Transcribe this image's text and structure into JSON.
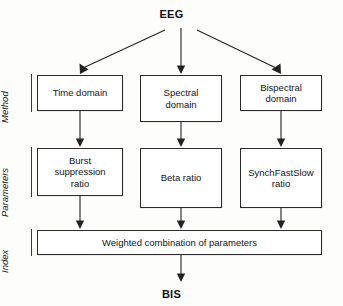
{
  "diagram": {
    "title_top": "EEG",
    "title_bottom": "BIS",
    "tiers": [
      {
        "id": "method",
        "label": "Method"
      },
      {
        "id": "parameters",
        "label": "Parameters"
      },
      {
        "id": "index",
        "label": "Index"
      }
    ],
    "nodes": {
      "time_domain": "Time domain",
      "spectral_domain": "Spectral\ndomain",
      "bispectral_domain": "Bispectral\ndomain",
      "burst_ratio": "Burst\nsuppression\nratio",
      "beta_ratio": "Beta ratio",
      "synch_ratio": "SynchFastSlow\nratio",
      "weighted": "Weighted combination of parameters"
    },
    "edges": [
      {
        "from": "EEG",
        "to": "Time domain"
      },
      {
        "from": "EEG",
        "to": "Spectral domain"
      },
      {
        "from": "EEG",
        "to": "Bispectral domain"
      },
      {
        "from": "Time domain",
        "to": "Burst suppression ratio"
      },
      {
        "from": "Spectral domain",
        "to": "Beta ratio"
      },
      {
        "from": "Bispectral domain",
        "to": "SynchFastSlow ratio"
      },
      {
        "from": "Burst suppression ratio",
        "to": "Weighted combination of parameters"
      },
      {
        "from": "Beta ratio",
        "to": "Weighted combination of parameters"
      },
      {
        "from": "SynchFastSlow ratio",
        "to": "Weighted combination of parameters"
      },
      {
        "from": "Weighted combination of parameters",
        "to": "BIS"
      }
    ],
    "colors": {
      "stroke": "#232323",
      "box_border": "#2b2b2b",
      "background": "#fdfdfc",
      "text": "#151515"
    }
  }
}
